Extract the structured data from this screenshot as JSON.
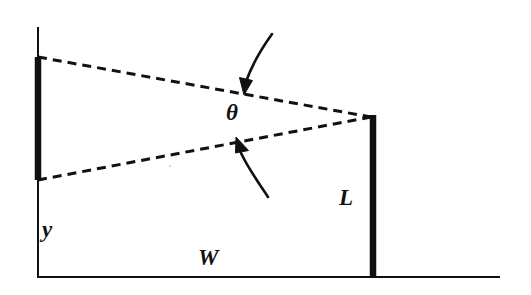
{
  "figure": {
    "type": "line-diagram",
    "background_color": "#ffffff",
    "ink_color": "#111111",
    "labels": {
      "theta": "θ",
      "length": "L",
      "height": "y",
      "width": "W"
    },
    "geometry": {
      "left_edge": {
        "x": 38,
        "thin_top_y0": 27,
        "thin_top_y1": 57,
        "thick_y0": 57,
        "thick_y1": 180,
        "thin_bottom_y0": 180,
        "thin_bottom_y1": 278,
        "thin_width": 2,
        "thick_width": 6
      },
      "bottom_edge": {
        "x0": 37,
        "x1": 500,
        "y": 277,
        "width": 2
      },
      "right_edge": {
        "x": 373,
        "y0": 116,
        "y1": 278,
        "width": 6
      },
      "dashed_upper": {
        "x0": 38,
        "y0": 57,
        "x1": 371,
        "y1": 117
      },
      "dashed_lower": {
        "x0": 38,
        "y0": 180,
        "x1": 371,
        "y1": 117
      },
      "apex": {
        "x": 371,
        "y": 117
      },
      "arrow_upper": {
        "tail_x": 270,
        "tail_y": 35,
        "head_x": 245,
        "head_y": 88,
        "points_to": "dashed-upper-line"
      },
      "arrow_lower": {
        "tail_x": 268,
        "tail_y": 196,
        "head_x": 238,
        "head_y": 145,
        "points_to": "dashed-lower-line"
      }
    }
  }
}
